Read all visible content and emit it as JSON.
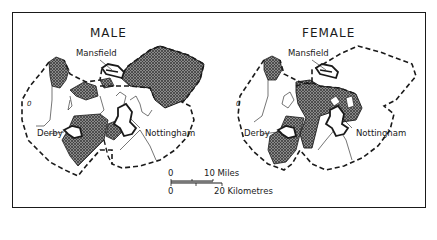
{
  "maps": [
    {
      "title": "MALE",
      "places": {
        "mansfield": "Mansfield",
        "derby": "Derby",
        "nottingham": "Nottingham"
      },
      "symbol": "0"
    },
    {
      "title": "FEMALE",
      "places": {
        "mansfield": "Mansfield",
        "derby": "Derby",
        "nottingham": "Nottingham"
      },
      "symbol": "0"
    }
  ],
  "scale_bar": {
    "miles_zero": "0",
    "miles_label": "10 Miles",
    "km_zero": "0",
    "km_label": "20 Kilometres"
  },
  "colors": {
    "ink": "#1a1a1a",
    "hatch_bg": "#9a9a9a",
    "paper": "#ffffff"
  }
}
